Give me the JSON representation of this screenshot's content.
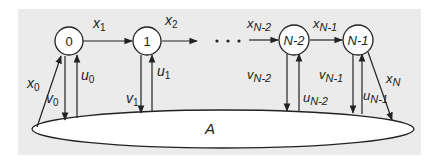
{
  "diagram": {
    "colors": {
      "background": "#ebebeb",
      "stroke": "#222222",
      "fill": "#ffffff"
    },
    "nodes": [
      {
        "id": "0",
        "label": "0"
      },
      {
        "id": "1",
        "label": "1"
      },
      {
        "id": "N-2",
        "label": "N-2"
      },
      {
        "id": "N-1",
        "label": "N-1"
      }
    ],
    "ellipse_label": "A",
    "ellipsis": "...",
    "edges": {
      "x0": {
        "base": "x",
        "sub": "0"
      },
      "x1": {
        "base": "x",
        "sub": "1"
      },
      "x2": {
        "base": "x",
        "sub": "2"
      },
      "xN2": {
        "base": "x",
        "sub": "N-2"
      },
      "xN1": {
        "base": "x",
        "sub": "N-1"
      },
      "xN": {
        "base": "x",
        "sub": "N"
      },
      "v0": {
        "base": "v",
        "sub": "0"
      },
      "u0": {
        "base": "u",
        "sub": "0"
      },
      "v1": {
        "base": "v",
        "sub": "1"
      },
      "u1": {
        "base": "u",
        "sub": "1"
      },
      "vN2": {
        "base": "v",
        "sub": "N-2"
      },
      "uN2": {
        "base": "u",
        "sub": "N-2"
      },
      "vN1": {
        "base": "v",
        "sub": "N-1"
      },
      "uN1": {
        "base": "u",
        "sub": "N-1"
      }
    }
  }
}
